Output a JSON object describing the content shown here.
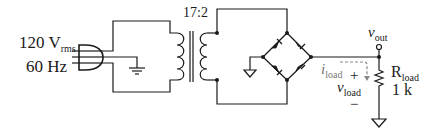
{
  "source": {
    "voltage": "120 V",
    "voltage_sub": "rms",
    "frequency": "60 Hz"
  },
  "transformer": {
    "ratio": "17:2"
  },
  "output": {
    "vout_main": "v",
    "vout_sub": "out"
  },
  "load": {
    "current_main": "i",
    "current_sub": "load",
    "voltage_main": "v",
    "voltage_sub": "load",
    "plus": "+",
    "minus": "−",
    "resistor_main": "R",
    "resistor_sub": "load",
    "resistor_value": "1 k"
  },
  "colors": {
    "wire": "#1a1a1a",
    "current_arrow": "#888888",
    "background": "#ffffff"
  },
  "icons": [
    "plug-icon",
    "transformer-icon",
    "diode-bridge-icon",
    "resistor-icon",
    "ground-icon"
  ]
}
